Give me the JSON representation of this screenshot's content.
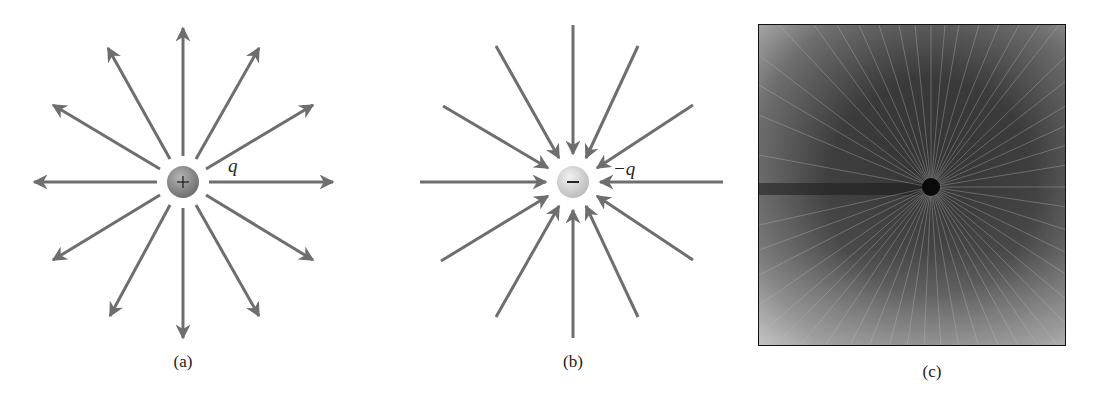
{
  "figure": {
    "panels": [
      {
        "id": "a",
        "caption": "(a)",
        "charge_sign": "+",
        "charge_label": "q",
        "field_direction": "outward",
        "line_count": 12
      },
      {
        "id": "b",
        "caption": "(b)",
        "charge_sign": "−",
        "charge_label": "−q",
        "field_direction": "inward",
        "line_count": 12
      },
      {
        "id": "c",
        "caption": "(c)",
        "description": "photograph of radial field pattern around a charged point"
      }
    ],
    "colors": {
      "arrow": "#6e6e6e",
      "charge_a": "#8a8a8a",
      "charge_b": "#d8d8d8",
      "photo_dark": "#2a2a2a",
      "photo_light": "#a9a9a9"
    }
  }
}
